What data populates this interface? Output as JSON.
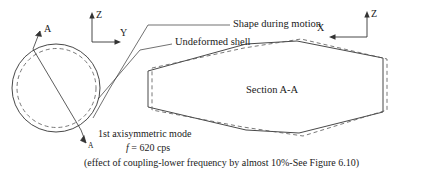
{
  "figure": {
    "kind": "engineering-diagram",
    "stroke_color": "#333333",
    "dashed_color": "#555555",
    "background": "#ffffff"
  },
  "axes": {
    "left": {
      "vertical_label": "Z",
      "horizontal_label": "Y"
    },
    "right": {
      "vertical_label": "Z",
      "horizontal_label": "X"
    }
  },
  "section_markers": {
    "top_label": "A",
    "bottom_label": "A",
    "section_title": "Section A-A"
  },
  "callouts": {
    "shape_during_motion": "Shape during motion",
    "undeformed_shell": "Undeformed shell"
  },
  "annotations": {
    "mode": "1st axisymmetric mode",
    "frequency_symbol": "f",
    "frequency_value": "= 620 cps",
    "note": "(effect of coupling-lower frequency by almost 10%-See Figure 6.10)"
  }
}
